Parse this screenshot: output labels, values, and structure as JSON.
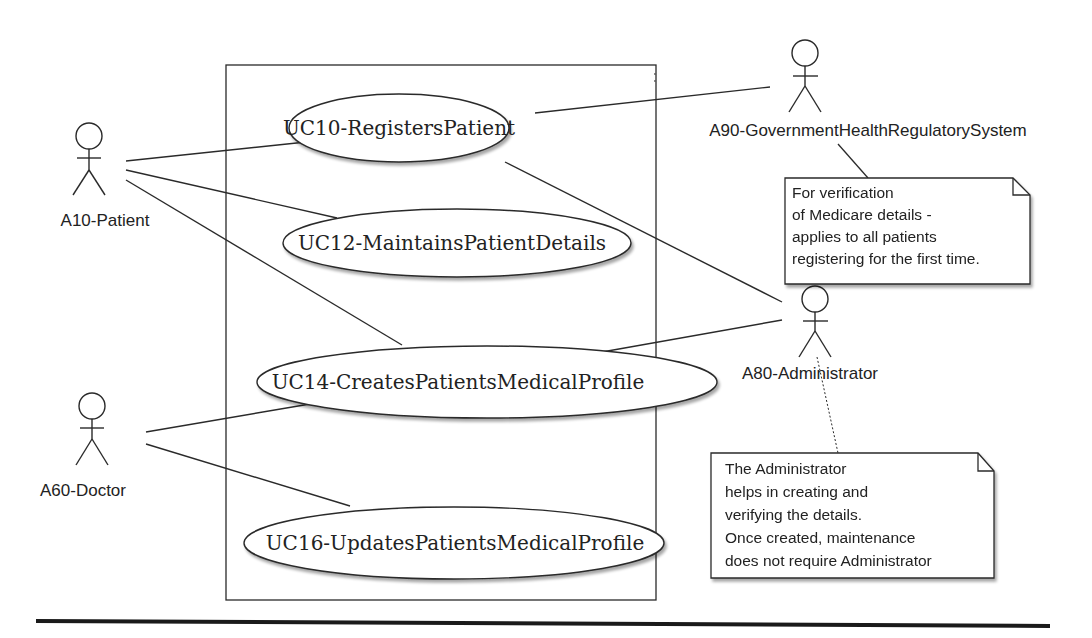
{
  "diagram": {
    "type": "uml-use-case",
    "system_boundary": {
      "x": 226,
      "y": 65,
      "width": 430,
      "height": 535
    },
    "use_cases": [
      {
        "id": "uc10",
        "label": "UC10-RegistersPatient",
        "cx": 399,
        "cy": 128,
        "rx": 110,
        "ry": 34
      },
      {
        "id": "uc12",
        "label": "UC12-MaintainsPatientDetails",
        "cx": 457,
        "cy": 243,
        "rx": 174,
        "ry": 34
      },
      {
        "id": "uc14",
        "label": "UC14-CreatesPatientsMedicalProfile",
        "cx": 487,
        "cy": 382,
        "rx": 230,
        "ry": 36
      },
      {
        "id": "uc16",
        "label": "UC16-UpdatesPatientsMedicalProfile",
        "cx": 454,
        "cy": 543,
        "rx": 210,
        "ry": 36
      }
    ],
    "actors": [
      {
        "id": "a10",
        "label": "A10-Patient",
        "x": 89,
        "head_y": 136,
        "label_x": 105,
        "label_y": 226
      },
      {
        "id": "a60",
        "label": "A60-Doctor",
        "x": 92,
        "head_y": 406,
        "label_x": 83,
        "label_y": 496
      },
      {
        "id": "a90",
        "label": "A90-GovernmentHealthRegulatorySystem",
        "x": 805,
        "head_y": 53,
        "label_x": 868,
        "label_y": 136
      },
      {
        "id": "a80",
        "label": "A80-Administrator",
        "x": 815,
        "head_y": 299,
        "label_x": 810,
        "label_y": 379
      }
    ],
    "associations": [
      {
        "from": "a10",
        "to": "uc10",
        "x1": 126,
        "y1": 161,
        "x2": 306,
        "y2": 142
      },
      {
        "from": "a10",
        "to": "uc12",
        "x1": 126,
        "y1": 170,
        "x2": 337,
        "y2": 218
      },
      {
        "from": "a10",
        "to": "uc14",
        "x1": 126,
        "y1": 180,
        "x2": 402,
        "y2": 345
      },
      {
        "from": "a60",
        "to": "uc14",
        "x1": 146,
        "y1": 432,
        "x2": 310,
        "y2": 404
      },
      {
        "from": "a60",
        "to": "uc16",
        "x1": 146,
        "y1": 444,
        "x2": 350,
        "y2": 506
      },
      {
        "from": "a90",
        "to": "uc10",
        "x1": 770,
        "y1": 87,
        "x2": 535,
        "y2": 113
      },
      {
        "from": "a80",
        "to": "uc10",
        "x1": 782,
        "y1": 302,
        "x2": 505,
        "y2": 162
      },
      {
        "from": "a80",
        "to": "uc14",
        "x1": 782,
        "y1": 320,
        "x2": 602,
        "y2": 352
      }
    ],
    "notes": [
      {
        "id": "note-verification",
        "x": 785,
        "y": 178,
        "width": 245,
        "height": 106,
        "anchor": {
          "x1": 838,
          "y1": 144,
          "x2": 868,
          "y2": 178,
          "style": "solid"
        },
        "lines": [
          "For verification",
          "of Medicare details -",
          "applies to all patients",
          "registering for the first time."
        ]
      },
      {
        "id": "note-administrator",
        "x": 711,
        "y": 453,
        "width": 283,
        "height": 125,
        "anchor": {
          "x1": 817,
          "y1": 357,
          "x2": 838,
          "y2": 453,
          "style": "dotted"
        },
        "lines": [
          "The Administrator",
          "helps in creating and",
          "verifying the details.",
          "Once created, maintenance",
          "does not require Administrator"
        ]
      }
    ],
    "footer_rule": {
      "x1": 36,
      "y1": 621,
      "x2": 1050,
      "y2": 626
    },
    "colors": {
      "stroke": "#2a2a2a",
      "text": "#222222",
      "background": "#ffffff",
      "shadow": "#bdbdbd"
    }
  }
}
